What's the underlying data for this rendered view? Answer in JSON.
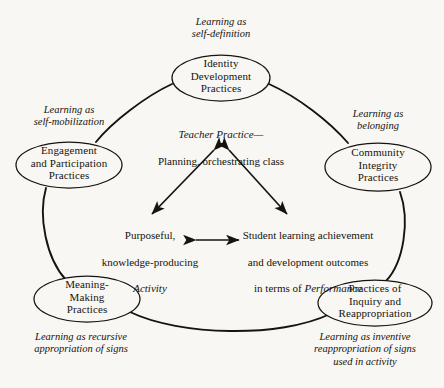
{
  "figure": {
    "type": "cycle-diagram",
    "background_color": "#f8f7f3",
    "stroke_color": "#16140f",
    "nodes": [
      {
        "id": "identity-development-practices",
        "label": "Identity\nDevelopment\nPractices",
        "caption": "Learning as\nself-definition",
        "position": "top"
      },
      {
        "id": "engagement-and-participation-practices",
        "label": "Engagement\nand Participation\nPractices",
        "caption": "Learning as\nself-mobilization",
        "position": "upper-left"
      },
      {
        "id": "community-integrity-practices",
        "label": "Community\nIntegrity\nPractices",
        "caption": "Learning as\nbelonging",
        "position": "upper-right"
      },
      {
        "id": "meaning-making-practices",
        "label": "Meaning-\nMaking\nPractices",
        "caption": "Learning as recursive\nappropriation of signs",
        "position": "lower-left"
      },
      {
        "id": "practices-of-inquiry-and-reappropriation",
        "label": "Practices of\nInquiry and\nReappropriation",
        "caption": "Learning as inventive\nreappropriation of signs\nused in activity",
        "position": "lower-right"
      }
    ],
    "center": {
      "teacher_practice": {
        "line1_italic": "Teacher Practice—",
        "line2": "Planning, orchestrating class"
      },
      "activity": {
        "line1": "Purposeful,",
        "line2": "knowledge-producing",
        "line3_italic": "Activity"
      },
      "outcomes": {
        "line1": "Student learning achievement",
        "line2": "and development outcomes",
        "line3_prefix": "in terms of ",
        "line3_italic": "Performance"
      }
    }
  }
}
